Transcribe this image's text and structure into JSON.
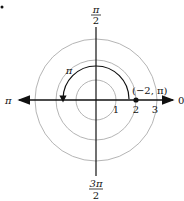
{
  "diagram": {
    "type": "polar-coordinate-plot",
    "angle_labels": {
      "top": {
        "num": "π",
        "den": "2"
      },
      "right": "0",
      "left": "π",
      "bottom": {
        "num": "3π",
        "den": "2"
      }
    },
    "radius_ticks": [
      "1",
      "2",
      "3"
    ],
    "arc_label": "π",
    "point_label": "(−2, π)",
    "colors": {
      "axis": "#111111",
      "grid_circle": "#b5b5b5",
      "arc": "#111111",
      "point": "#111111"
    }
  }
}
